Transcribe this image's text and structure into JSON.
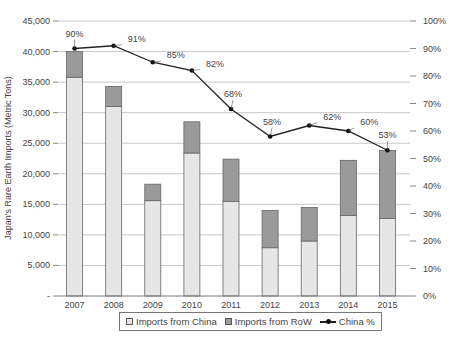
{
  "chart_data": {
    "type": "bar",
    "subtype": "stacked-bar-with-line-secondary-axis",
    "title": "",
    "xlabel": "",
    "ylabel": "Japan's Rare Earth Imports (Metric Tons)",
    "y2label": "",
    "categories": [
      "2007",
      "2008",
      "2009",
      "2010",
      "2011",
      "2012",
      "2013",
      "2014",
      "2015"
    ],
    "series": [
      {
        "name": "Imports from China",
        "type": "bar",
        "axis": "left",
        "color": "#e6e6e6",
        "values": [
          35800,
          31000,
          15600,
          23400,
          15500,
          7900,
          9000,
          13200,
          12700
        ]
      },
      {
        "name": "Imports from RoW",
        "type": "bar",
        "axis": "left",
        "color": "#9a9a9a",
        "values": [
          4200,
          3300,
          2700,
          5100,
          6900,
          6100,
          5500,
          9000,
          11100
        ]
      },
      {
        "name": "China %",
        "type": "line",
        "axis": "right",
        "color": "#222222",
        "values": [
          90,
          91,
          85,
          82,
          68,
          58,
          62,
          60,
          53
        ]
      }
    ],
    "data_labels": [
      "90%",
      "91%",
      "85%",
      "82%",
      "68%",
      "58%",
      "62%",
      "60%",
      "53%"
    ],
    "ylim": [
      0,
      45000
    ],
    "y2lim": [
      0,
      100
    ],
    "yticks": [
      "-",
      "5,000",
      "10,000",
      "15,000",
      "20,000",
      "25,000",
      "30,000",
      "35,000",
      "40,000",
      "45,000"
    ],
    "y2ticks": [
      "0%",
      "10%",
      "20%",
      "30%",
      "40%",
      "50%",
      "60%",
      "70%",
      "80%",
      "90%",
      "100%"
    ],
    "grid": true,
    "legend_position": "bottom"
  },
  "legend": {
    "items": [
      {
        "label": "Imports from China",
        "color": "#e6e6e6"
      },
      {
        "label": "Imports from RoW",
        "color": "#9a9a9a"
      },
      {
        "label": "China %"
      }
    ]
  },
  "colors": {
    "grid": "#c8c8c8",
    "bar_border": "#666666",
    "line": "#222222",
    "axis_text": "#444444"
  }
}
